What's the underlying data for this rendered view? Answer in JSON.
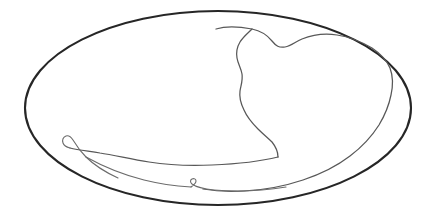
{
  "image": {
    "title": "Line drawing of an oval plate with an irregular inner contour",
    "subject": "oval-plate-line-drawing",
    "medium": "ink line drawing",
    "background_color": "#ffffff",
    "width": 435,
    "height": 220
  },
  "palette": {
    "background": "#ffffff",
    "outer_outline": "#262626",
    "inner_outline": "#585858",
    "inner_outline_faint": "#6b6b6b"
  },
  "shapes": {
    "outer_ellipse": {
      "name": "plate-rim",
      "description": "Large hand-drawn ellipse forming the rim of an oval dish",
      "center_x": 218,
      "center_y": 108,
      "radius_x": 193,
      "radius_y": 97,
      "stroke_color": "#262626",
      "stroke_width": 2.1,
      "path": "M 25 108 C 25 55 112 11 218 11 C 324 11 411 55 411 108 C 411 161 324 205 218 205 C 112 205 25 161 25 108 Z"
    },
    "inner_contour": {
      "name": "inner-crescent-contour",
      "description": "Irregular wavy inner line sweeping from the upper middle, down the centre in an S-curve, then left along the bottom to a pointed hook, and back right along the rim",
      "stroke_color": "#585858",
      "stroke_width": 1.25,
      "path": "M 216 29 C 226 26 241 27 252 29 C 262 31 268 36 272 41 C 276 46 279 48 285 47 C 291 46 295 42 302 39 C 312 35 324 33 337 35 C 350 37 362 42 372 48 C 381 54 387 61 390 68 C 393 76 393 86 391 95 C 389 105 385 115 379 125 C 372 136 362 147 350 156 C 337 166 321 174 303 180 C 285 186 265 190 244 191 C 228 192 214 191 203 189",
      "segments": [
        {
          "name": "upper-left-tip",
          "x": 216,
          "y": 29
        },
        {
          "name": "upper-ridge",
          "x": 272,
          "y": 41
        },
        {
          "name": "upper-right-sweep",
          "x": 337,
          "y": 35
        },
        {
          "name": "right-shoulder",
          "x": 390,
          "y": 68
        },
        {
          "name": "lower-right-bend",
          "x": 350,
          "y": 156
        },
        {
          "name": "bottom-return",
          "x": 203,
          "y": 189
        }
      ]
    },
    "inner_descending_wave": {
      "name": "inner-central-wave",
      "description": "Wavy vertical line descending from the upper ridge down the centre of the plate to the lower belly",
      "stroke_color": "#585858",
      "stroke_width": 1.25,
      "path": "M 252 29 C 248 33 243 37 240 42 C 237 47 236 52 237 58 C 238 64 241 68 242 74 C 243 80 241 85 240 91 C 239 98 241 104 244 110 C 247 117 252 123 258 129 C 263 134 268 138 272 142 C 276 147 278 152 278 157"
    },
    "inner_lower_sweep": {
      "name": "inner-lower-belly-sweep",
      "description": "Long sweeping line running from the lower centre leftwards to the pointed hook at the left",
      "stroke_color": "#585858",
      "stroke_width": 1.25,
      "path": "M 278 157 C 258 162 236 164 212 165 C 190 166 168 165 149 162 C 130 159 114 155 100 153 C 88 151 78 150 70 148"
    },
    "inner_left_hook": {
      "name": "inner-left-pointed-hook",
      "description": "Narrow pointed hook at the far left where the contour folds back on itself",
      "stroke_color": "#585858",
      "stroke_width": 1.2,
      "path": "M 70 148 C 66 147 64 146 63 143 C 62 140 63 137 66 136 C 69 135 71 137 73 140 C 76 145 80 151 86 157 C 94 165 105 172 118 178"
    },
    "inner_bottom_return": {
      "name": "inner-bottom-return-line",
      "description": "Lower line returning rightwards from the hook along the base of the plate toward the small notch",
      "stroke_color": "#585858",
      "stroke_width": 1.2,
      "path": "M 86 157 C 104 167 124 175 144 180 C 160 184 176 186 191 187"
    },
    "inner_bottom_notch": {
      "name": "inner-bottom-notch",
      "description": "Small sharp arrow-like notch near the bottom centre where the contour doubles back",
      "stroke_color": "#585858",
      "stroke_width": 1.15,
      "path": "M 191 187 C 194 185 196 183 196 181 C 196 179 194 178 192 179 C 190 180 190 182 192 184 C 196 187 204 189 214 190 C 236 192 262 191 286 187"
    }
  },
  "annotations": {
    "has_text": false,
    "text_items": [],
    "stroke_count": 7,
    "style": "single-weight ink contour, no shading, no fill"
  }
}
